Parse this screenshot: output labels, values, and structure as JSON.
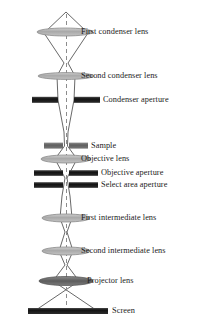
{
  "diagram": {
    "optical_axis_x": 66,
    "axis_style": "dashed-gray-vertical",
    "colors": {
      "ray_line": "#4a4a4a",
      "lens_fill_light": "#b9b9b9",
      "lens_fill_dark": "#6e6e6e",
      "lens_stroke": "#7a7a7a",
      "aperture_dark": "#1a1a1a",
      "sample_gray": "#636363",
      "axis_dash": "#8c8c8c",
      "label_text": "#1b1b1b",
      "background": "#ffffff"
    },
    "components": [
      {
        "id": "first-condenser-lens",
        "label": "First condenser lens",
        "kind": "lens",
        "shade": "light",
        "y": 32,
        "half_width": 28,
        "half_height": 4,
        "label_x": 81,
        "label_y": 27
      },
      {
        "id": "second-condenser-lens",
        "label": "Second condenser lens",
        "kind": "lens",
        "shade": "light",
        "y": 76,
        "half_width": 28,
        "half_height": 3.5,
        "label_x": 81,
        "label_y": 71
      },
      {
        "id": "condenser-aperture",
        "label": "Condenser aperture",
        "kind": "aperture",
        "y": 100,
        "half_width": 34,
        "thickness": 6,
        "gap_half_width": 3,
        "label_x": 103,
        "label_y": 95
      },
      {
        "id": "sample",
        "label": "Sample",
        "kind": "aperture",
        "y": 146,
        "half_width": 18,
        "thickness": 6,
        "gap_half_width": 2.5,
        "shade": "gray",
        "label_x": 81,
        "label_y": 141
      },
      {
        "id": "objective-lens",
        "label": "Objective lens",
        "kind": "lens",
        "shade": "light",
        "y": 159,
        "half_width": 25,
        "half_height": 4,
        "label_x": 81,
        "label_y": 154
      },
      {
        "id": "objective-aperture",
        "label": "Objective aperture",
        "kind": "aperture",
        "y": 173,
        "half_width": 32,
        "thickness": 5.5,
        "gap_half_width": 2.5,
        "label_x": 81,
        "label_y": 168
      },
      {
        "id": "select-area-aperture",
        "label": "Select area aperture",
        "kind": "aperture",
        "y": 185,
        "half_width": 32,
        "thickness": 5.5,
        "gap_half_width": 2.5,
        "label_x": 81,
        "label_y": 180
      },
      {
        "id": "first-intermediate-lens",
        "label": "First intermediate lens",
        "kind": "lens",
        "shade": "light",
        "y": 218,
        "half_width": 24,
        "half_height": 4,
        "label_x": 81,
        "label_y": 213
      },
      {
        "id": "second-intermediate-lens",
        "label": "Second intermediate lens",
        "kind": "lens",
        "shade": "light",
        "y": 251,
        "half_width": 24,
        "half_height": 4,
        "label_x": 81,
        "label_y": 246
      },
      {
        "id": "projector-lens",
        "label": "Projector lens",
        "kind": "lens",
        "shade": "dark",
        "y": 281,
        "half_width": 27,
        "half_height": 4.5,
        "label_x": 87,
        "label_y": 276
      },
      {
        "id": "screen",
        "label": "Screen",
        "kind": "screen",
        "y": 311,
        "x_left": 28,
        "x_right": 108,
        "thickness": 6,
        "label_x": 112,
        "label_y": 306
      }
    ],
    "beam": {
      "source_apex": {
        "x": 66,
        "y": 12
      },
      "crossovers_y": [
        64,
        139,
        202,
        236,
        265
      ],
      "envelope_description": "Electron beam from a point source spreads through the first condenser lens, converges to a crossover, is shaped by the second condenser lens and condenser aperture into a narrow column through the sample, then diverges and forms successive crossovers at the objective, intermediate and projector lenses before striking the screen.",
      "screen_half_width": 30
    }
  }
}
